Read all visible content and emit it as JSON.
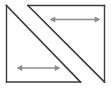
{
  "figure": {
    "type": "geometry-diagram",
    "canvas": {
      "width": 111,
      "height": 91,
      "background": "#ffffff"
    },
    "colors": {
      "outline": "#3c3c3c",
      "diagonal": "#3c3c3c",
      "arrow": "#8c8c8c",
      "background": "#ffffff"
    },
    "stroke_widths": {
      "outline": 1.4,
      "diagonal": 1.6,
      "arrow": 1.3
    },
    "shapes": {
      "left_edge": {
        "label": "left vertical side",
        "x1": 6.5,
        "y1": 5.5,
        "x2": 6.5,
        "y2": 82.0
      },
      "right_edge": {
        "label": "right vertical side",
        "x1": 104.5,
        "y1": 5.5,
        "x2": 104.5,
        "y2": 82.0
      },
      "top_edge": {
        "label": "top horizontal side",
        "x1": 28.0,
        "y1": 5.5,
        "x2": 104.5,
        "y2": 5.5
      },
      "bottom_edge": {
        "label": "bottom horizontal side",
        "x1": 6.5,
        "y1": 82.0,
        "x2": 80.5,
        "y2": 82.0
      },
      "diagonal_left": {
        "label": "upper-left to lower-right diagonal",
        "x1": 6.5,
        "y1": 5.5,
        "x2": 80.5,
        "y2": 82.0
      },
      "diagonal_right": {
        "label": "second parallel diagonal",
        "x1": 28.0,
        "y1": 5.5,
        "x2": 104.5,
        "y2": 82.0
      }
    },
    "arrows": [
      {
        "name": "upper-right-measure-arrow",
        "label": "",
        "double_headed": true,
        "orientation": "horizontal",
        "x1": 55.0,
        "y1": 19.5,
        "x2": 95.0,
        "y2": 19.5,
        "length_px": 40
      },
      {
        "name": "lower-left-measure-arrow",
        "label": "",
        "double_headed": true,
        "orientation": "horizontal",
        "x1": 22.0,
        "y1": 68.0,
        "x2": 55.0,
        "y2": 68.0,
        "length_px": 33
      }
    ]
  }
}
